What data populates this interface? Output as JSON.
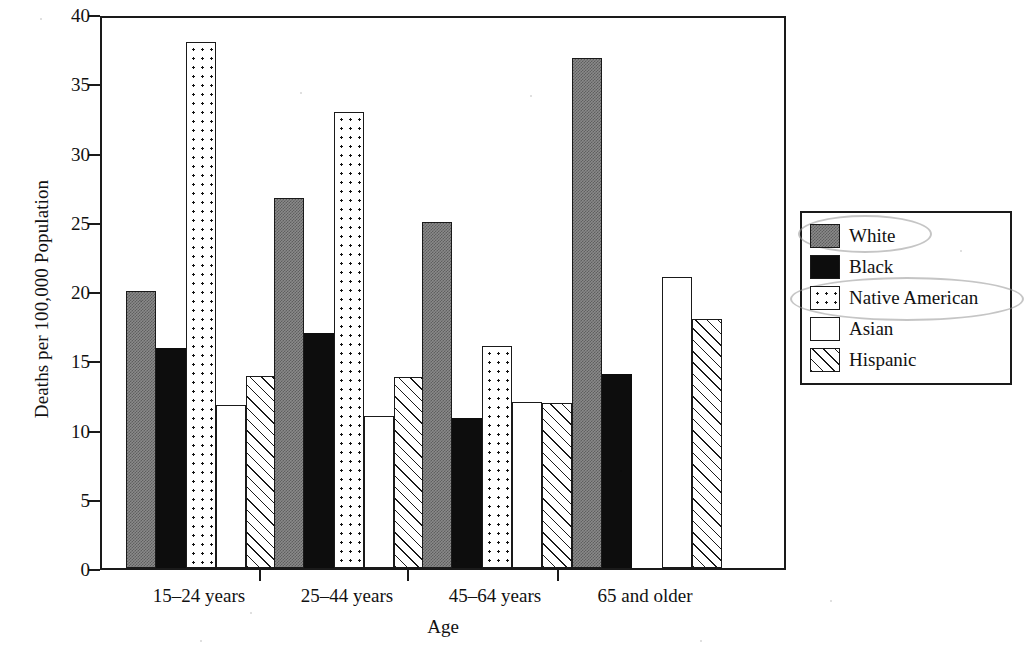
{
  "chart_data": {
    "type": "bar",
    "title": "",
    "xlabel": "Age",
    "ylabel": "Deaths per 100,000 Population",
    "categories": [
      "15–24 years",
      "25–44 years",
      "45–64 years",
      "65 and older"
    ],
    "series": [
      {
        "name": "White",
        "pattern": "gray-fill",
        "values": [
          20.0,
          26.7,
          25.0,
          36.8
        ]
      },
      {
        "name": "Black",
        "pattern": "solid-black",
        "values": [
          15.9,
          17.0,
          10.8,
          14.0
        ]
      },
      {
        "name": "Native American",
        "pattern": "dotted",
        "values": [
          38.0,
          32.9,
          16.0,
          null
        ]
      },
      {
        "name": "Asian",
        "pattern": "white-empty",
        "values": [
          11.8,
          11.0,
          12.0,
          21.0
        ]
      },
      {
        "name": "Hispanic",
        "pattern": "diagonal-hatch",
        "values": [
          13.9,
          13.8,
          11.9,
          18.0
        ]
      }
    ],
    "ylim": [
      0,
      40
    ],
    "yticks": [
      0,
      5,
      10,
      15,
      20,
      25,
      30,
      35,
      40
    ],
    "ytick_labels": [
      "0",
      "5",
      "10",
      "15",
      "20",
      "25",
      "30",
      "35",
      "40"
    ],
    "grid": false,
    "legend_position": "right-outside",
    "legend_entries": [
      "White",
      "Black",
      "Native American",
      "Asian",
      "Hispanic"
    ],
    "annotations": [
      {
        "kind": "hand-drawn-circle",
        "target": "White"
      },
      {
        "kind": "hand-drawn-circle",
        "target": "Native American"
      }
    ]
  },
  "axis": {
    "y_title": "Deaths per 100,000 Population",
    "x_title": "Age"
  },
  "colors": {
    "axis": "#1a1a1a",
    "white_series": "#8a8a8a",
    "black_series": "#0d0d0d",
    "background": "#ffffff",
    "annotation": "#969696"
  }
}
